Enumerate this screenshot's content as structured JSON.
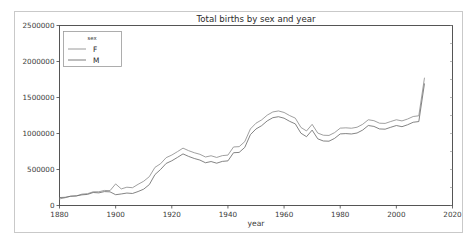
{
  "figure": {
    "title": "Total births by sex and year",
    "legend_title": "sex"
  },
  "axes": {
    "xlabel": "year",
    "ylabel": "",
    "xticks": [
      "1880",
      "1900",
      "1920",
      "1940",
      "1960",
      "1980",
      "2000",
      "2020"
    ],
    "yticks": [
      "0",
      "500000",
      "1000000",
      "1500000",
      "2000000",
      "2500000"
    ]
  },
  "colors": {
    "series_f": "#8f8f8f",
    "series_m": "#6e6e6e",
    "axis": "#444444",
    "frame": "#c9c9c9",
    "background": "#ffffff"
  },
  "chart_data": {
    "type": "line",
    "title": "Total births by sex and year",
    "xlabel": "year",
    "ylabel": "",
    "xlim": [
      1880,
      2020
    ],
    "ylim": [
      0,
      2500000
    ],
    "xticks": [
      1880,
      1900,
      1920,
      1940,
      1960,
      1980,
      2000,
      2020
    ],
    "yticks": [
      0,
      500000,
      1000000,
      1500000,
      2000000,
      2500000
    ],
    "grid": false,
    "legend_title": "sex",
    "legend_position": "upper left",
    "x": [
      1880,
      1882,
      1884,
      1886,
      1888,
      1890,
      1892,
      1894,
      1896,
      1898,
      1900,
      1902,
      1904,
      1906,
      1908,
      1910,
      1912,
      1914,
      1916,
      1918,
      1920,
      1922,
      1924,
      1926,
      1928,
      1930,
      1932,
      1934,
      1936,
      1938,
      1940,
      1942,
      1944,
      1946,
      1948,
      1950,
      1952,
      1954,
      1956,
      1958,
      1960,
      1962,
      1964,
      1966,
      1968,
      1970,
      1972,
      1974,
      1976,
      1978,
      1980,
      1982,
      1984,
      1986,
      1988,
      1990,
      1992,
      1994,
      1996,
      1998,
      2000,
      2002,
      2004,
      2006,
      2008,
      2010
    ],
    "series": [
      {
        "name": "F",
        "values": [
          90993,
          107850,
          129022,
          133055,
          157937,
          164244,
          190431,
          190528,
          209091,
          206594,
          299873,
          230229,
          253963,
          247102,
          294200,
          337106,
          400647,
          529367,
          580034,
          664519,
          700753,
          747498,
          796728,
          761651,
          733192,
          711306,
          673812,
          690549,
          667470,
          692504,
          699947,
          813034,
          817300,
          886988,
          1063296,
          1143178,
          1188570,
          1255172,
          1299387,
          1313168,
          1292448,
          1248755,
          1213419,
          1084303,
          1035489,
          1127079,
          1006124,
          975913,
          973079,
          1012276,
          1074281,
          1078739,
          1073304,
          1086878,
          1127471,
          1191001,
          1178364,
          1143219,
          1140020,
          1166499,
          1190869,
          1174716,
          1201172,
          1236046,
          1246005,
          1769325
        ],
        "note_scale": "values are schematic reading of plotted curve"
      },
      {
        "name": "M",
        "values": [
          110490,
          113686,
          129021,
          133055,
          147937,
          154244,
          180431,
          175528,
          193091,
          189594,
          149873,
          160229,
          172963,
          167102,
          194200,
          227106,
          290647,
          429367,
          500034,
          584519,
          620753,
          667498,
          716728,
          681651,
          653192,
          631306,
          593812,
          610549,
          587470,
          612504,
          619947,
          733034,
          737300,
          806988,
          983296,
          1063178,
          1108570,
          1175172,
          1219387,
          1233168,
          1212448,
          1168755,
          1133419,
          1004303,
          955489,
          1047079,
          926124,
          895913,
          893079,
          932276,
          994281,
          998739,
          993304,
          1006878,
          1047471,
          1111001,
          1098364,
          1063219,
          1060020,
          1086499,
          1110869,
          1094716,
          1121172,
          1156046,
          1166005,
          1689325
        ],
        "note_scale": "values are schematic reading of plotted curve"
      }
    ],
    "annotations": [
      "Both sexes start near 100k-200k in 1880 and rise slowly with a spike around 1900",
      "Steep rise 1910-1920 to roughly 1,200,000 (F) reflecting improved registration coverage",
      "Plateau near 1,000,000-1,200,000 through the 1920s-1930s",
      "Sharp post-war jump in 1946 followed by baby boom peak near 2,150,000 around 1957-1961",
      "Decline through the 1970s trough near 1,550,000, secondary peak near 1990 and 2007",
      "Series F consistently plots slightly above series M across the full record"
    ]
  }
}
